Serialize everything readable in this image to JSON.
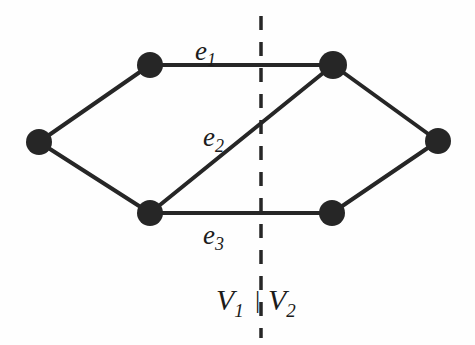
{
  "figure": {
    "background_color": "#fefefe",
    "ink_color": "#262626"
  },
  "labels": {
    "e1": {
      "base": "e",
      "sub": "1",
      "text": "e1"
    },
    "e2": {
      "base": "e",
      "sub": "2",
      "text": "e2"
    },
    "e3": {
      "base": "e",
      "sub": "3",
      "text": "e3"
    },
    "v1": {
      "base": "V",
      "sub": "1",
      "text": "V1"
    },
    "v2": {
      "base": "V",
      "sub": "2",
      "text": "V2"
    },
    "separator": "|"
  },
  "chart_data": {
    "type": "diagram",
    "diagram_kind": "graph-cut",
    "vertices": [
      {
        "id": "left",
        "x": 39,
        "y": 142,
        "r": 13,
        "partition": "V1"
      },
      {
        "id": "upper-left",
        "x": 150,
        "y": 65,
        "r": 13,
        "partition": "V1"
      },
      {
        "id": "lower-left",
        "x": 150,
        "y": 213,
        "r": 13,
        "partition": "V1"
      },
      {
        "id": "upper-right",
        "x": 333,
        "y": 65,
        "r": 14,
        "partition": "V2"
      },
      {
        "id": "lower-right",
        "x": 332,
        "y": 213,
        "r": 13,
        "partition": "V2"
      },
      {
        "id": "right",
        "x": 438,
        "y": 141,
        "r": 13,
        "partition": "V2"
      }
    ],
    "edges": [
      {
        "id": "edge-left-upperleft",
        "from": "left",
        "to": "upper-left",
        "label": ""
      },
      {
        "id": "edge-left-lowerleft",
        "from": "left",
        "to": "lower-left",
        "label": ""
      },
      {
        "id": "edge-e1",
        "from": "upper-left",
        "to": "upper-right",
        "label": "e1",
        "crosses_cut": true
      },
      {
        "id": "edge-e2",
        "from": "lower-left",
        "to": "upper-right",
        "label": "e2",
        "crosses_cut": true
      },
      {
        "id": "edge-e3",
        "from": "lower-left",
        "to": "lower-right",
        "label": "e3",
        "crosses_cut": true
      },
      {
        "id": "edge-upperright-right",
        "from": "upper-right",
        "to": "right",
        "label": ""
      },
      {
        "id": "edge-lowerright-right",
        "from": "lower-right",
        "to": "right",
        "label": ""
      }
    ],
    "cut_line": {
      "orientation": "vertical",
      "x": 261,
      "y_start": 16,
      "y_end": 338,
      "style": "dashed",
      "dash_pattern": "14 12",
      "width": 3.5
    },
    "partitions": [
      {
        "name": "V1",
        "side": "left",
        "members": [
          "left",
          "upper-left",
          "lower-left"
        ]
      },
      {
        "name": "V2",
        "side": "right",
        "members": [
          "upper-right",
          "lower-right",
          "right"
        ]
      }
    ],
    "cut_size": 3,
    "cut_edges": [
      "e1",
      "e2",
      "e3"
    ]
  }
}
